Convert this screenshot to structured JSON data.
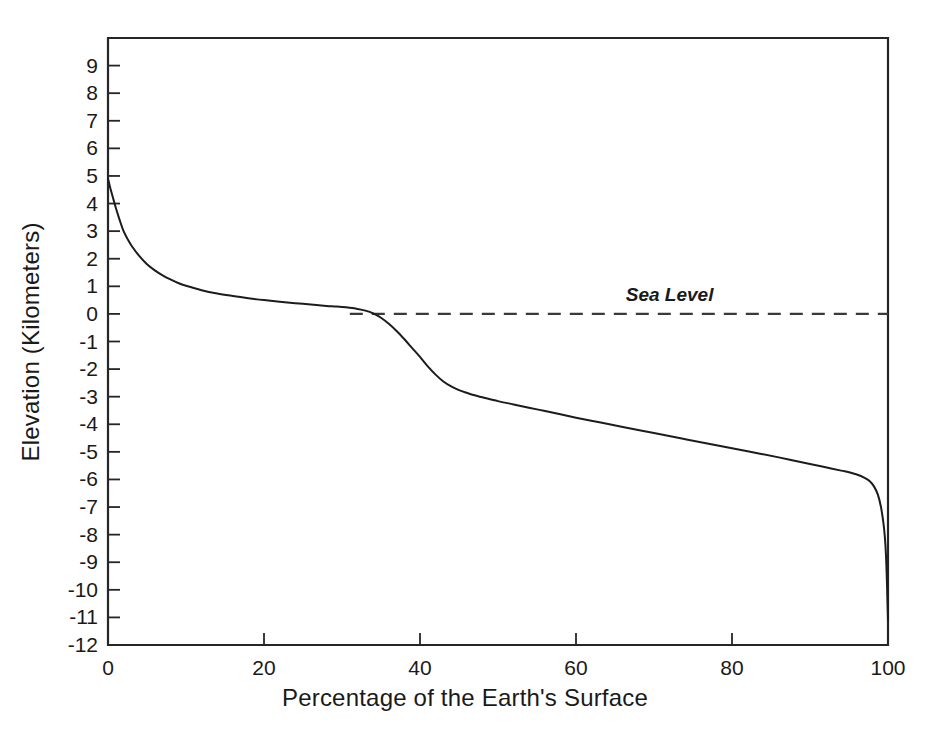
{
  "figure": {
    "background_color": "#ffffff",
    "ink_color": "#1a1a1a",
    "caption_fragment": ""
  },
  "chart_data": {
    "type": "line",
    "title": "",
    "xlabel": "Percentage of the Earth's Surface",
    "ylabel": "Elevation (Kilometers)",
    "xlim": [
      0,
      100
    ],
    "ylim": [
      -12,
      10
    ],
    "grid": false,
    "legend_position": "none",
    "xticks": [
      0,
      20,
      40,
      60,
      80,
      100
    ],
    "xtick_labels": [
      "0",
      "20",
      "40",
      "60",
      "80",
      "100"
    ],
    "yticks": [
      9,
      8,
      7,
      6,
      5,
      4,
      3,
      2,
      1,
      0,
      -1,
      -2,
      -3,
      -4,
      -5,
      -6,
      -7,
      -8,
      -9,
      -10,
      -11,
      -12
    ],
    "ytick_labels": [
      "9",
      "8",
      "7",
      "6",
      "5",
      "4",
      "3",
      "2",
      "1",
      "0",
      "-1",
      "-2",
      "-3",
      "-4",
      "-5",
      "-6",
      "-7",
      "-8",
      "-9",
      "-10",
      "-11",
      "-12"
    ],
    "annotations": [
      {
        "text": "Sea Level",
        "x": 72,
        "y": 0.45,
        "style": "italic",
        "line": {
          "type": "dashed",
          "y": 0,
          "x_start": 31,
          "x_end": 100
        }
      }
    ],
    "series": [
      {
        "name": "Hypsometric curve",
        "x": [
          0,
          0.3,
          0.6,
          1,
          1.5,
          2,
          2.5,
          3,
          4,
          5,
          6,
          7,
          8,
          9,
          10,
          12,
          14,
          16,
          18,
          20,
          22,
          24,
          26,
          28,
          29,
          30,
          31,
          32,
          33,
          34,
          35,
          36,
          37,
          38,
          39,
          40,
          41,
          42,
          43,
          44,
          45,
          46,
          47,
          48,
          50,
          52,
          55,
          58,
          60,
          63,
          66,
          70,
          74,
          78,
          82,
          86,
          90,
          92,
          94,
          95,
          96,
          97,
          97.6,
          98.2,
          98.7,
          99.1,
          99.4,
          99.6,
          99.75,
          99.85,
          99.92,
          100
        ],
        "y": [
          4.9,
          4.55,
          4.25,
          3.85,
          3.4,
          3.0,
          2.72,
          2.48,
          2.1,
          1.8,
          1.58,
          1.4,
          1.25,
          1.12,
          1.02,
          0.86,
          0.74,
          0.65,
          0.57,
          0.5,
          0.44,
          0.39,
          0.34,
          0.29,
          0.27,
          0.25,
          0.22,
          0.18,
          0.12,
          0.02,
          -0.14,
          -0.36,
          -0.62,
          -0.92,
          -1.24,
          -1.56,
          -1.9,
          -2.2,
          -2.45,
          -2.63,
          -2.76,
          -2.86,
          -2.95,
          -3.02,
          -3.16,
          -3.28,
          -3.46,
          -3.64,
          -3.76,
          -3.93,
          -4.1,
          -4.32,
          -4.54,
          -4.76,
          -4.98,
          -5.2,
          -5.44,
          -5.56,
          -5.68,
          -5.74,
          -5.82,
          -5.94,
          -6.05,
          -6.25,
          -6.55,
          -7.0,
          -7.55,
          -8.1,
          -8.8,
          -9.6,
          -10.3,
          -11.1
        ],
        "color": "#1c1c1c",
        "style": "solid"
      }
    ]
  }
}
